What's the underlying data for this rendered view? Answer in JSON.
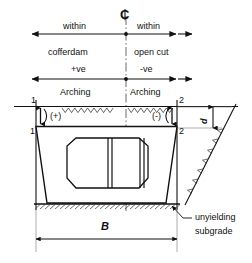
{
  "diagram": {
    "centerline_symbol": "₵",
    "top_band": {
      "left_line1": "within",
      "left_line2": "cofferdam",
      "right_line1": "within",
      "right_line2": "open cut"
    },
    "arching_band": {
      "left_sign": "+ve",
      "right_sign": "-ve",
      "left_label": "Arching",
      "right_label": "Arching"
    },
    "section_marks": {
      "top_left": "1",
      "top_right": "2",
      "bottom_left": "1",
      "bottom_right": "2"
    },
    "deflection": {
      "left": "(+)",
      "right": "(-)"
    },
    "dimensions": {
      "width": "B",
      "depth": "d"
    },
    "annotation": {
      "line1": "unyielding",
      "line2": "subgrade"
    },
    "colors": {
      "ink": "#111111",
      "line": "#1a1a1a",
      "thin": "#555555"
    }
  }
}
